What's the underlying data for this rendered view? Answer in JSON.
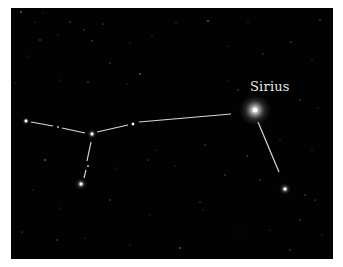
{
  "labels": {
    "sirius": "Sirius"
  },
  "colors": {
    "background": "#020202",
    "border": "#ffffff",
    "line": "#d8d8d8",
    "label": "#e6e6e6"
  },
  "stars": [
    {
      "name": "Sirius",
      "x": 255,
      "y": 110,
      "r": 2.5,
      "glow": 16
    },
    {
      "name": "left-star",
      "x": 26,
      "y": 121,
      "r": 1.4,
      "glow": 4
    },
    {
      "name": "junction-star",
      "x": 92,
      "y": 134,
      "r": 1.4,
      "glow": 5
    },
    {
      "name": "middle-star",
      "x": 133,
      "y": 124,
      "r": 1.2,
      "glow": 3
    },
    {
      "name": "lower-left-star",
      "x": 81,
      "y": 184,
      "r": 1.5,
      "glow": 6
    },
    {
      "name": "lower-right-star",
      "x": 285,
      "y": 189,
      "r": 1.5,
      "glow": 6
    },
    {
      "name": "small-star-a",
      "x": 58,
      "y": 127,
      "r": 0.8,
      "glow": 1.5
    },
    {
      "name": "small-star-b",
      "x": 88,
      "y": 166,
      "r": 0.8,
      "glow": 1.5
    }
  ],
  "lines": [
    {
      "x1": 31,
      "y1": 122,
      "x2": 53,
      "y2": 126
    },
    {
      "x1": 62,
      "y1": 128,
      "x2": 85,
      "y2": 133
    },
    {
      "x1": 97,
      "y1": 132,
      "x2": 128,
      "y2": 125
    },
    {
      "x1": 139,
      "y1": 122,
      "x2": 231,
      "y2": 114
    },
    {
      "x1": 91,
      "y1": 142,
      "x2": 87,
      "y2": 161
    },
    {
      "x1": 86,
      "y1": 170,
      "x2": 84,
      "y2": 178
    },
    {
      "x1": 258,
      "y1": 122,
      "x2": 279,
      "y2": 172
    }
  ],
  "background_stars": [
    [
      21,
      12
    ],
    [
      43,
      13
    ],
    [
      35,
      22
    ],
    [
      70,
      22
    ],
    [
      103,
      24
    ],
    [
      58,
      35
    ],
    [
      40,
      40
    ],
    [
      27,
      56
    ],
    [
      84,
      30
    ],
    [
      92,
      41
    ],
    [
      130,
      43
    ],
    [
      176,
      23
    ],
    [
      208,
      21
    ],
    [
      152,
      36
    ],
    [
      228,
      46
    ],
    [
      291,
      42
    ],
    [
      263,
      54
    ],
    [
      248,
      22
    ],
    [
      320,
      20
    ],
    [
      312,
      60
    ],
    [
      110,
      63
    ],
    [
      88,
      82
    ],
    [
      60,
      80
    ],
    [
      127,
      84
    ],
    [
      140,
      74
    ],
    [
      15,
      83
    ],
    [
      228,
      81
    ],
    [
      238,
      90
    ],
    [
      300,
      100
    ],
    [
      318,
      108
    ],
    [
      205,
      145
    ],
    [
      156,
      150
    ],
    [
      148,
      160
    ],
    [
      247,
      156
    ],
    [
      280,
      140
    ],
    [
      312,
      150
    ],
    [
      45,
      160
    ],
    [
      115,
      168
    ],
    [
      175,
      166
    ],
    [
      225,
      175
    ],
    [
      200,
      202
    ],
    [
      203,
      210
    ],
    [
      110,
      200
    ],
    [
      60,
      208
    ],
    [
      22,
      232
    ],
    [
      57,
      240
    ],
    [
      85,
      238
    ],
    [
      130,
      245
    ],
    [
      180,
      248
    ],
    [
      240,
      232
    ],
    [
      270,
      230
    ],
    [
      300,
      220
    ],
    [
      315,
      200
    ],
    [
      322,
      235
    ],
    [
      290,
      250
    ],
    [
      150,
      215
    ],
    [
      260,
      180
    ],
    [
      305,
      195
    ],
    [
      33,
      190
    ],
    [
      175,
      118
    ]
  ]
}
